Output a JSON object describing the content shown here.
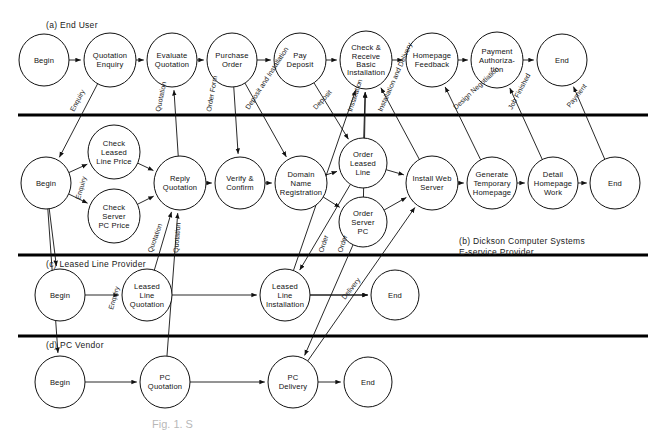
{
  "figure": {
    "caption": "Fig. 1. S",
    "lanes": [
      {
        "id": "a",
        "label": "(a) End User"
      },
      {
        "id": "b",
        "label": "(b) Dickson Computer Systems\nE-service Provider"
      },
      {
        "id": "c",
        "label": "(c) Leased Line Provider"
      },
      {
        "id": "d",
        "label": "(d) PC Vendor"
      }
    ]
  },
  "nodes": {
    "a": [
      {
        "id": "a1",
        "label": "Begin",
        "x": 44,
        "y": 60,
        "rx": 25,
        "ry": 26
      },
      {
        "id": "a2",
        "label": "Quotation\nEnquiry",
        "x": 110,
        "y": 60,
        "rx": 26,
        "ry": 27
      },
      {
        "id": "a3",
        "label": "Evaluate\nQuotation",
        "x": 172,
        "y": 60,
        "rx": 25,
        "ry": 27
      },
      {
        "id": "a4",
        "label": "Purchase\nOrder",
        "x": 232,
        "y": 60,
        "rx": 25,
        "ry": 27
      },
      {
        "id": "a5",
        "label": "Pay\nDeposit",
        "x": 300,
        "y": 60,
        "rx": 26,
        "ry": 27
      },
      {
        "id": "a6",
        "label": "Check &\nReceive\nBasic\nInstallation",
        "x": 366,
        "y": 60,
        "rx": 26,
        "ry": 29
      },
      {
        "id": "a7",
        "label": "Homepage\nFeedback",
        "x": 432,
        "y": 60,
        "rx": 26,
        "ry": 27
      },
      {
        "id": "a8",
        "label": "Payment\nAuthoriza-\ntion",
        "x": 497,
        "y": 60,
        "rx": 26,
        "ry": 28
      },
      {
        "id": "a9",
        "label": "End",
        "x": 562,
        "y": 60,
        "rx": 25,
        "ry": 26
      }
    ],
    "b": [
      {
        "id": "b1",
        "label": "Begin",
        "x": 46,
        "y": 183,
        "rx": 25,
        "ry": 26
      },
      {
        "id": "b2",
        "label": "Check\nLeased\nLine Price",
        "x": 114,
        "y": 152,
        "rx": 26,
        "ry": 27
      },
      {
        "id": "b3",
        "label": "Check\nServer\nPC Price",
        "x": 114,
        "y": 216,
        "rx": 26,
        "ry": 27
      },
      {
        "id": "b4",
        "label": "Reply\nQuotation",
        "x": 180,
        "y": 183,
        "rx": 26,
        "ry": 27
      },
      {
        "id": "b5",
        "label": "Verify &\nConfirm",
        "x": 240,
        "y": 183,
        "rx": 25,
        "ry": 26
      },
      {
        "id": "b6",
        "label": "Domain\nName\nRegistration",
        "x": 301,
        "y": 183,
        "rx": 26,
        "ry": 27
      },
      {
        "id": "b7",
        "label": "Order\nLeased\nLine",
        "x": 363,
        "y": 163,
        "rx": 24,
        "ry": 25
      },
      {
        "id": "b8",
        "label": "Order\nServer\nPC",
        "x": 363,
        "y": 222,
        "rx": 24,
        "ry": 25
      },
      {
        "id": "b9",
        "label": "Install Web\nServer",
        "x": 432,
        "y": 183,
        "rx": 26,
        "ry": 27
      },
      {
        "id": "b10",
        "label": "Generate\nTemporary\nHomepage",
        "x": 492,
        "y": 183,
        "rx": 25,
        "ry": 26
      },
      {
        "id": "b11",
        "label": "Detail\nHomepage\nWork",
        "x": 553,
        "y": 183,
        "rx": 25,
        "ry": 26
      },
      {
        "id": "b12",
        "label": "End",
        "x": 615,
        "y": 183,
        "rx": 25,
        "ry": 26
      }
    ],
    "c": [
      {
        "id": "c1",
        "label": "Begin",
        "x": 60,
        "y": 295,
        "rx": 25,
        "ry": 26
      },
      {
        "id": "c2",
        "label": "Leased\nLine\nQuotation",
        "x": 147,
        "y": 295,
        "rx": 25,
        "ry": 26
      },
      {
        "id": "c3",
        "label": "Leased\nLine\nInstallation",
        "x": 285,
        "y": 295,
        "rx": 25,
        "ry": 26
      },
      {
        "id": "c4",
        "label": "End",
        "x": 395,
        "y": 295,
        "rx": 24,
        "ry": 25
      }
    ],
    "d": [
      {
        "id": "d1",
        "label": "Begin",
        "x": 60,
        "y": 382,
        "rx": 25,
        "ry": 26
      },
      {
        "id": "d2",
        "label": "PC\nQuotation",
        "x": 165,
        "y": 382,
        "rx": 25,
        "ry": 26
      },
      {
        "id": "d3",
        "label": "PC\nDelivery",
        "x": 293,
        "y": 382,
        "rx": 25,
        "ry": 26
      },
      {
        "id": "d4",
        "label": "End",
        "x": 368,
        "y": 382,
        "rx": 24,
        "ry": 25
      }
    ]
  },
  "edge_labels": [
    {
      "id": "el1",
      "text": "Enquiry",
      "x": 74,
      "y": 112,
      "rot": -62
    },
    {
      "id": "el2",
      "text": "Quotation",
      "x": 160,
      "y": 112,
      "rot": -78
    },
    {
      "id": "el3",
      "text": "Order Form",
      "x": 211,
      "y": 112,
      "rot": -80
    },
    {
      "id": "el4",
      "text": "Deposit and Installation",
      "x": 249,
      "y": 110,
      "rot": -57
    },
    {
      "id": "el5",
      "text": "Deposit",
      "x": 316,
      "y": 110,
      "rot": -47
    },
    {
      "id": "el6",
      "text": "Installation",
      "x": 352,
      "y": 112,
      "rot": -72
    },
    {
      "id": "el7",
      "text": "Installation and Delivery",
      "x": 382,
      "y": 112,
      "rot": -66
    },
    {
      "id": "el8",
      "text": "Design Negotiation",
      "x": 456,
      "y": 110,
      "rot": -43
    },
    {
      "id": "el9",
      "text": "Job Finished",
      "x": 512,
      "y": 110,
      "rot": -62
    },
    {
      "id": "el10",
      "text": "Payment",
      "x": 570,
      "y": 108,
      "rot": -52
    },
    {
      "id": "el11",
      "text": "Enquiry",
      "x": 80,
      "y": 200,
      "rot": -74
    },
    {
      "id": "el12",
      "text": "Quotation",
      "x": 152,
      "y": 253,
      "rot": -70
    },
    {
      "id": "el13",
      "text": "Quotation",
      "x": 178,
      "y": 253,
      "rot": -85
    },
    {
      "id": "el14",
      "text": "Order",
      "x": 323,
      "y": 253,
      "rot": -72
    },
    {
      "id": "el15",
      "text": "Order",
      "x": 342,
      "y": 253,
      "rot": -72
    },
    {
      "id": "el16",
      "text": "Enquiry",
      "x": 113,
      "y": 310,
      "rot": -74
    },
    {
      "id": "el17",
      "text": "Delivery",
      "x": 345,
      "y": 300,
      "rot": -52
    }
  ],
  "lane_dividers": [
    115,
    255,
    336
  ]
}
